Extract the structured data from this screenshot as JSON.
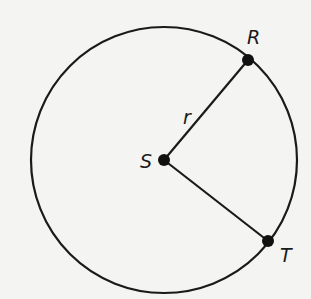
{
  "diagram": {
    "type": "circle",
    "center": {
      "label": "S",
      "x": 164,
      "y": 160
    },
    "radius_px": 133,
    "points": [
      {
        "label": "R",
        "x": 248,
        "y": 60
      },
      {
        "label": "T",
        "x": 268,
        "y": 241
      }
    ],
    "segments": [
      {
        "from": "S",
        "to": "R",
        "label": "r"
      },
      {
        "from": "S",
        "to": "T",
        "label": ""
      }
    ],
    "colors": {
      "stroke": "#1a1a1a",
      "background": "#f4f4f2"
    }
  }
}
